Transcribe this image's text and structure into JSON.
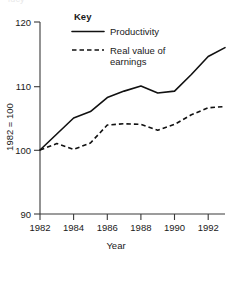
{
  "page": {
    "cut_off_header_fragment": "lucy"
  },
  "chart_data": {
    "type": "line",
    "title": "",
    "xlabel": "Year",
    "ylabel": "1982 = 100",
    "xlim": [
      1982,
      1993
    ],
    "ylim": [
      90,
      120
    ],
    "yticks": [
      90,
      100,
      110,
      120
    ],
    "ytick_labels": [
      "90",
      "100",
      "110",
      "120"
    ],
    "xticks": [
      1982,
      1984,
      1986,
      1988,
      1990,
      1992
    ],
    "xtick_labels": [
      "1982",
      "1984",
      "1986",
      "1988",
      "1990",
      "1992"
    ],
    "grid": false,
    "legend_position": "top-center",
    "x": [
      1982,
      1983,
      1984,
      1985,
      1986,
      1987,
      1988,
      1989,
      1990,
      1991,
      1992,
      1993
    ],
    "series": [
      {
        "name": "Productivity",
        "style": "solid",
        "color": "#111111",
        "values": [
          100.0,
          102.5,
          105.0,
          106.0,
          108.2,
          109.2,
          110.0,
          108.9,
          109.2,
          111.8,
          114.6,
          116.0
        ]
      },
      {
        "name": "Real value of earnings",
        "style": "dashed",
        "color": "#111111",
        "values": [
          100.0,
          101.0,
          100.1,
          101.1,
          103.9,
          104.1,
          104.0,
          103.1,
          104.0,
          105.5,
          106.6,
          106.8
        ]
      }
    ]
  },
  "legend": {
    "title": "Key",
    "entries": [
      {
        "label": "Productivity",
        "style": "solid"
      },
      {
        "label": "Real value of",
        "label_line2": "earnings",
        "style": "dashed"
      }
    ]
  },
  "axes": {
    "y_axis_title": "1982 = 100",
    "x_axis_title": "Year"
  }
}
